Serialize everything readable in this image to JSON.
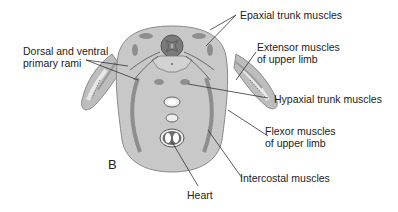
{
  "diagram": {
    "panel_letter": "B",
    "labels": {
      "epaxial": "Epaxial trunk muscles",
      "dorsal_ventral_line1": "Dorsal and ventral",
      "dorsal_ventral_line2": "primary rami",
      "extensor_line1": "Extensor muscles",
      "extensor_line2": "of upper limb",
      "hypaxial": "Hypaxial trunk muscles",
      "flexor_line1": "Flexor muscles",
      "flexor_line2": "of upper limb",
      "intercostal": "Intercostal muscles",
      "heart": "Heart"
    },
    "colors": {
      "body_fill": "#c4c4c4",
      "body_outline": "#8a8a8a",
      "muscle": "#8e8e8e",
      "spinal_cord": "#7a7a7a",
      "leader_line": "#333333",
      "text": "#222222"
    }
  }
}
